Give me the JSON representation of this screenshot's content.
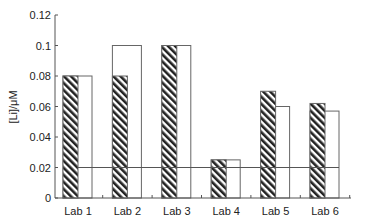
{
  "chart_data": {
    "type": "bar",
    "title": "",
    "xlabel": "",
    "ylabel": "[Li]/μM",
    "ylim": [
      0,
      0.12
    ],
    "yticks": [
      0,
      0.02,
      0.04,
      0.06,
      0.08,
      0.1,
      0.12
    ],
    "ytick_labels": [
      "0",
      "0.02",
      "0.04",
      "0.06",
      "0.08",
      "0.1",
      "0.12"
    ],
    "categories": [
      "Lab 1",
      "Lab 2",
      "Lab 3",
      "Lab 4",
      "Lab 5",
      "Lab 6"
    ],
    "series": [
      {
        "name": "hatched",
        "pattern": "diagonal-hatch",
        "values": [
          0.08,
          0.08,
          0.1,
          0.025,
          0.07,
          0.062
        ]
      },
      {
        "name": "white",
        "pattern": "none",
        "values": [
          0.08,
          0.1,
          0.1,
          0.025,
          0.06,
          0.057
        ]
      }
    ],
    "reference_line": {
      "value": 0.02,
      "orientation": "horizontal"
    },
    "grid": false,
    "legend": null
  },
  "colors": {
    "axis": "#555555",
    "bar_border": "#666666",
    "hatch": "#222222",
    "white_bar": "#ffffff",
    "reference_line": "#555555"
  }
}
